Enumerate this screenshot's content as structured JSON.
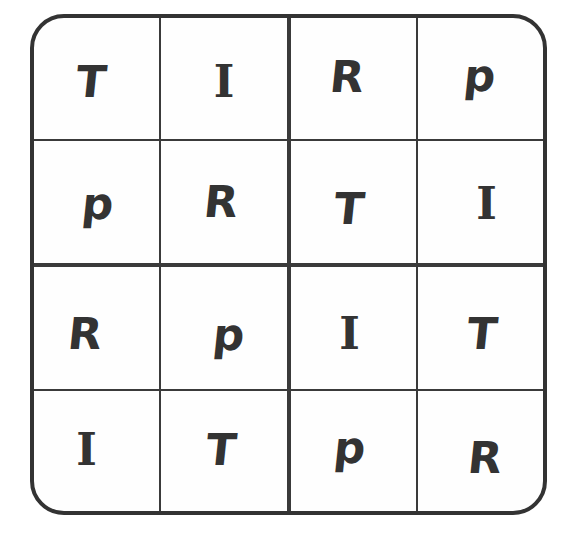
{
  "puzzle": {
    "type": "4x4 letter sudoku",
    "symbols": [
      "T",
      "I",
      "R",
      "p"
    ],
    "grid": [
      [
        "T",
        "I",
        "R",
        "p"
      ],
      [
        "p",
        "R",
        "T",
        "I"
      ],
      [
        "R",
        "p",
        "I",
        "T"
      ],
      [
        "I",
        "T",
        "p",
        "R"
      ]
    ],
    "colors": {
      "line": "#333333",
      "glyph": "#333333",
      "background": "#ffffff"
    }
  }
}
